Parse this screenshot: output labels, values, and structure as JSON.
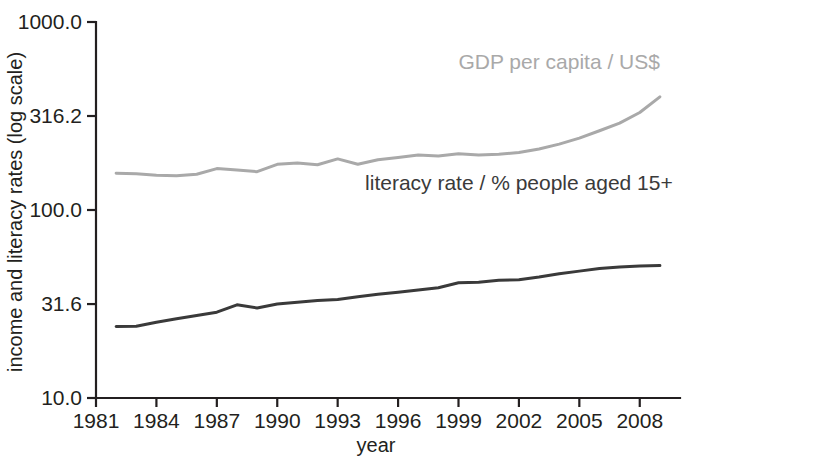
{
  "chart_data": {
    "type": "line",
    "title": "",
    "xlabel": "year",
    "ylabel": "income and literacy rates (log scale)",
    "yscale": "log",
    "ylim": [
      10.0,
      1000.0
    ],
    "xlim": [
      1981,
      2009
    ],
    "grid": false,
    "legend_position": "inline-annotation",
    "y_ticks": [
      10.0,
      31.6,
      100.0,
      316.2,
      1000.0
    ],
    "y_tick_labels": [
      "10.0",
      "31.6",
      "100.0",
      "316.2",
      "1000.0"
    ],
    "x_ticks": [
      1981,
      1984,
      1987,
      1990,
      1993,
      1996,
      1999,
      2002,
      2005,
      2008
    ],
    "x_tick_labels": [
      "1981",
      "1984",
      "1987",
      "1990",
      "1993",
      "1996",
      "1999",
      "2002",
      "2005",
      "2008"
    ],
    "x": [
      1982,
      1983,
      1984,
      1985,
      1986,
      1987,
      1988,
      1989,
      1990,
      1991,
      1992,
      1993,
      1994,
      1995,
      1996,
      1997,
      1998,
      1999,
      2000,
      2001,
      2002,
      2003,
      2004,
      2005,
      2006,
      2007,
      2008,
      2009
    ],
    "series": [
      {
        "name": "GDP per capita / US$",
        "color": "#a9a9a9",
        "label_x": 2004,
        "label_y": 560,
        "values": [
          157,
          156,
          153,
          152,
          155,
          166,
          163,
          160,
          175,
          178,
          174,
          187,
          175,
          185,
          190,
          196,
          194,
          199,
          196,
          198,
          202,
          211,
          224,
          241,
          264,
          290,
          330,
          400
        ]
      },
      {
        "name": "literacy rate / % people aged 15+",
        "color": "#3a3a3a",
        "label_x": 2002,
        "label_y": 128,
        "values": [
          24.0,
          24.1,
          25.3,
          26.4,
          27.5,
          28.6,
          31.3,
          30.1,
          31.6,
          32.3,
          33.0,
          33.4,
          34.6,
          35.6,
          36.5,
          37.5,
          38.6,
          41.0,
          41.3,
          42.3,
          42.6,
          44.0,
          45.8,
          47.3,
          48.9,
          49.8,
          50.3,
          50.6
        ]
      }
    ]
  },
  "axis": {
    "y_label": "income and literacy rates (log scale)",
    "x_label": "year"
  }
}
